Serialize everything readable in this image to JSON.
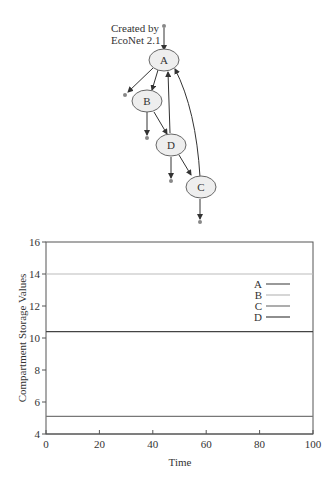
{
  "diagram": {
    "credit_line1": "Created by",
    "credit_line2": "EcoNet 2.1",
    "nodes": [
      {
        "id": "A",
        "label": "A"
      },
      {
        "id": "B",
        "label": "B"
      },
      {
        "id": "C",
        "label": "C"
      },
      {
        "id": "D",
        "label": "D"
      }
    ],
    "edges": [
      {
        "from": "input",
        "to": "A"
      },
      {
        "from": "A",
        "to": "output"
      },
      {
        "from": "A",
        "to": "B"
      },
      {
        "from": "B",
        "to": "output"
      },
      {
        "from": "B",
        "to": "D"
      },
      {
        "from": "D",
        "to": "A"
      },
      {
        "from": "D",
        "to": "output"
      },
      {
        "from": "D",
        "to": "C"
      },
      {
        "from": "C",
        "to": "A"
      },
      {
        "from": "C",
        "to": "output"
      }
    ]
  },
  "chart_data": {
    "type": "line",
    "title": "",
    "xlabel": "Time",
    "ylabel": "Compartment Storage Values",
    "xlim": [
      0,
      100
    ],
    "ylim": [
      4,
      16
    ],
    "xticks": [
      0,
      20,
      40,
      60,
      80,
      100
    ],
    "yticks": [
      4,
      6,
      8,
      10,
      12,
      14,
      16
    ],
    "grid": false,
    "legend_position": "right",
    "x": [
      0,
      100
    ],
    "series": [
      {
        "name": "A",
        "values": [
          4.0,
          4.0
        ],
        "color": "#555555"
      },
      {
        "name": "B",
        "values": [
          14.0,
          14.0
        ],
        "color": "#bbbbbb"
      },
      {
        "name": "C",
        "values": [
          5.1,
          5.1
        ],
        "color": "#777777"
      },
      {
        "name": "D",
        "values": [
          10.4,
          10.4
        ],
        "color": "#444444"
      }
    ]
  }
}
